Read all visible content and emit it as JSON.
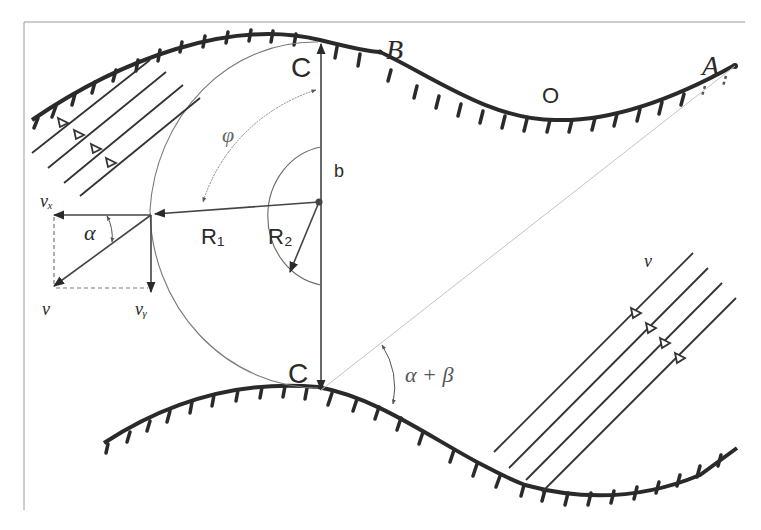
{
  "diagram": {
    "type": "flow-channel geometry diagram",
    "labels": {
      "C_top": "C",
      "C_bottom": "C",
      "B": "B",
      "A": "A",
      "O": "O",
      "phi": "φ",
      "b": "b",
      "R1": "R₁",
      "R2": "R₂",
      "alpha": "α",
      "alpha_plus_beta": "α + β",
      "v": "v",
      "vx": "vₓ",
      "vy": "vᵧ",
      "v_right": "v"
    },
    "elements": [
      "upper-wall (hatched curve from left through C, B, O to A)",
      "lower-wall (hatched curve from left through C to right)",
      "vertical line C–C with arrowheads",
      "arc R1 (large semicircle)",
      "arc R2 (small semicircle)",
      "velocity decomposition v, vx, vy with angle α",
      "incoming streamlines upper-left (4 lines with arrows)",
      "incoming streamlines lower-right (4 lines with arrows)",
      "angle α+β between line C–A and lower wall"
    ],
    "colors": {
      "ink": "#2a2a2a",
      "thin": "#6a6a6a",
      "faint": "#b8b8b8",
      "background": "#ffffff"
    }
  }
}
